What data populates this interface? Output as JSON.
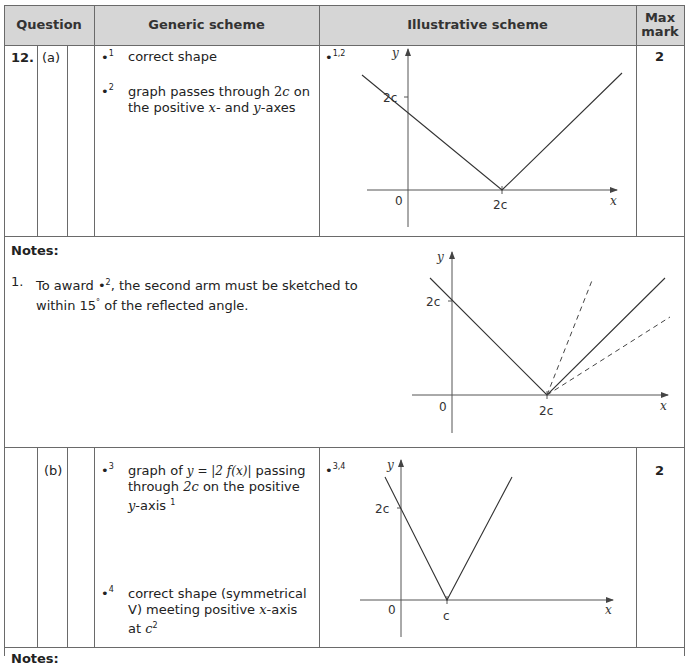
{
  "header": {
    "question": "Question",
    "generic": "Generic scheme",
    "illustrative": "Illustrative scheme",
    "max_mark_line1": "Max",
    "max_mark_line2": "mark"
  },
  "part_a": {
    "question_number": "12.",
    "part_label": "(a)",
    "criteria": [
      {
        "bullet": "•",
        "index": "1",
        "text": "correct shape"
      },
      {
        "bullet": "•",
        "index": "2",
        "text_parts": [
          "graph passes through ",
          "2c",
          " on",
          "the positive ",
          "x",
          "- and ",
          "y",
          "-axes"
        ]
      }
    ],
    "illustrative_bullet": "•",
    "illustrative_index": "1,2",
    "graph": {
      "y_label": "y",
      "x_label": "x",
      "origin_label": "0",
      "y_intercept_label": "2c",
      "x_intercept_label": "2c"
    },
    "max_mark": "2"
  },
  "notes_a": {
    "title": "Notes:",
    "items": [
      {
        "number": "1.",
        "parts": [
          "To award ",
          "•",
          "2",
          ", the second arm must be sketched to",
          "within 15",
          "°",
          " of the reflected angle."
        ]
      }
    ],
    "graph": {
      "y_label": "y",
      "x_label": "x",
      "origin_label": "0",
      "y_intercept_label": "2c",
      "x_intercept_label": "2c"
    }
  },
  "part_b": {
    "part_label": "(b)",
    "criteria": [
      {
        "bullet": "•",
        "index": "3",
        "line1_pre": "graph of ",
        "formula": "y = |2 f(x)|",
        "line1_post": " passing",
        "line2_pre": "through ",
        "line2_math": "2c",
        "line2_post": " on the positive",
        "line3_math": "y",
        "line3_post": "-axis ",
        "footnote": "1"
      },
      {
        "bullet": "•",
        "index": "4",
        "line1": "correct shape (symmetrical",
        "line2_pre": "V) meeting positive ",
        "line2_math": "x",
        "line2_post": "-axis",
        "line3_pre": "at ",
        "line3_math": "c",
        "footnote": "2"
      }
    ],
    "illustrative_bullet": "•",
    "illustrative_index": "3,4",
    "graph": {
      "y_label": "y",
      "x_label": "x",
      "origin_label": "0",
      "y_intercept_label": "2c",
      "x_intercept_label": "c"
    },
    "max_mark": "2"
  },
  "notes_b": {
    "title": "Notes:"
  }
}
